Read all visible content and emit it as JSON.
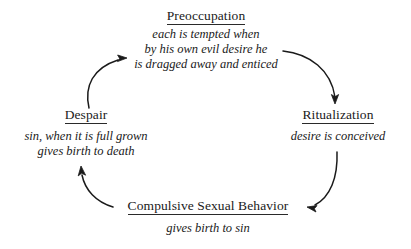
{
  "diagram": {
    "background_color": "#ffffff",
    "text_color": "#1a1a1a",
    "arrow_color": "#1a1a1a",
    "nodes": [
      {
        "id": "preoccupation",
        "title": "Preoccupation",
        "lines": [
          "each is tempted when",
          "by his own evil desire he",
          "is dragged away and enticed"
        ]
      },
      {
        "id": "ritualization",
        "title": "Ritualization",
        "lines": [
          "desire is conceived"
        ]
      },
      {
        "id": "compulsive-sexual-behavior",
        "title": "Compulsive Sexual Behavior",
        "lines": [
          "gives birth to sin"
        ]
      },
      {
        "id": "despair",
        "title": "Despair",
        "lines": [
          "sin, when it is full grown",
          "gives birth to death"
        ]
      }
    ],
    "arrows": [
      {
        "id": "preoccupation-to-ritualization",
        "from": "preoccupation",
        "to": "ritualization",
        "direction": "clockwise-top-right",
        "head": "down"
      },
      {
        "id": "ritualization-to-compulsive",
        "from": "ritualization",
        "to": "compulsive-sexual-behavior",
        "direction": "clockwise-bottom-right",
        "head": "left"
      },
      {
        "id": "compulsive-to-despair",
        "from": "compulsive-sexual-behavior",
        "to": "despair",
        "direction": "clockwise-bottom-left",
        "head": "up"
      },
      {
        "id": "despair-to-preoccupation",
        "from": "despair",
        "to": "preoccupation",
        "direction": "clockwise-top-left",
        "head": "right"
      }
    ]
  }
}
